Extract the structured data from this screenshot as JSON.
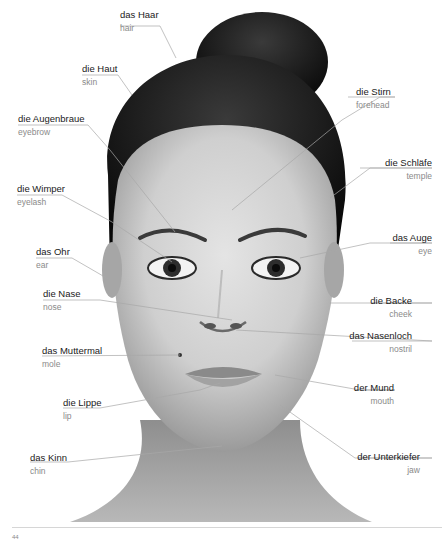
{
  "diagram": {
    "colors": {
      "line": "#a8a8a8",
      "german": "#1a1a1a",
      "english": "#8a8a8a",
      "hair": "#111111",
      "skin": "#c9c9c9"
    },
    "labels_left": [
      {
        "id": "hair",
        "de": "das Haar",
        "en": "hair"
      },
      {
        "id": "skin",
        "de": "die Haut",
        "en": "skin"
      },
      {
        "id": "eyebrow",
        "de": "die Augenbraue",
        "en": "eyebrow"
      },
      {
        "id": "eyelash",
        "de": "die Wimper",
        "en": "eyelash"
      },
      {
        "id": "ear",
        "de": "das Ohr",
        "en": "ear"
      },
      {
        "id": "nose",
        "de": "die Nase",
        "en": "nose"
      },
      {
        "id": "mole",
        "de": "das Muttermal",
        "en": "mole"
      },
      {
        "id": "lip",
        "de": "die Lippe",
        "en": "lip"
      },
      {
        "id": "chin",
        "de": "das Kinn",
        "en": "chin"
      }
    ],
    "labels_right": [
      {
        "id": "forehead",
        "de": "die Stirn",
        "en": "forehead"
      },
      {
        "id": "temple",
        "de": "die Schläfe",
        "en": "temple"
      },
      {
        "id": "eye",
        "de": "das Auge",
        "en": "eye"
      },
      {
        "id": "cheek",
        "de": "die Backe",
        "en": "cheek"
      },
      {
        "id": "nostril",
        "de": "das Nasenloch",
        "en": "nostril"
      },
      {
        "id": "mouth",
        "de": "der Mund",
        "en": "mouth"
      },
      {
        "id": "jaw",
        "de": "der Unterkiefer",
        "en": "jaw"
      }
    ]
  },
  "footer": {
    "page_number": "44"
  }
}
